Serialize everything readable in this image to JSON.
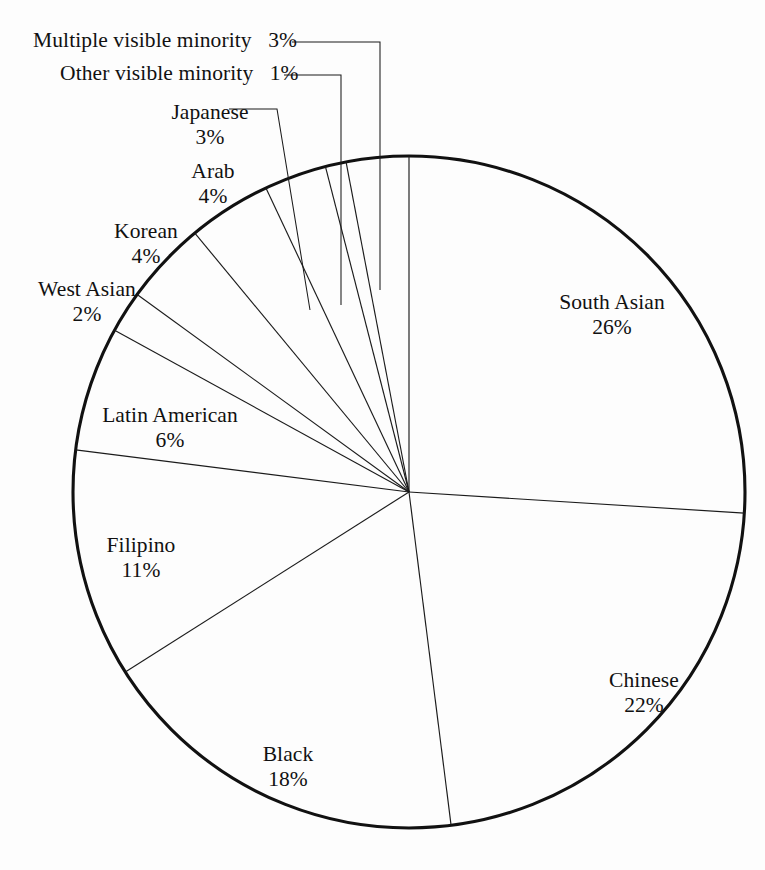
{
  "chart_data": {
    "type": "pie",
    "title": "",
    "subtitle": "",
    "xlabel": "",
    "ylabel": "",
    "legend_position": "none",
    "grid": false,
    "labels_show_percent": true,
    "start_angle_deg": 0,
    "direction": "clockwise",
    "categories": [
      "South Asian",
      "Chinese",
      "Black",
      "Filipino",
      "Latin American",
      "West Asian",
      "Korean",
      "Arab",
      "Japanese",
      "Other visible minority",
      "Multiple visible minority"
    ],
    "values": [
      26,
      22,
      18,
      11,
      6,
      2,
      4,
      4,
      3,
      1,
      3
    ],
    "units": "percent",
    "total": 100,
    "slices": [
      {
        "label": "South Asian",
        "value": 26,
        "percent_text": "26%"
      },
      {
        "label": "Chinese",
        "value": 22,
        "percent_text": "22%"
      },
      {
        "label": "Black",
        "value": 18,
        "percent_text": "18%"
      },
      {
        "label": "Filipino",
        "value": 11,
        "percent_text": "11%"
      },
      {
        "label": "Latin American",
        "value": 6,
        "percent_text": "6%"
      },
      {
        "label": "West Asian",
        "value": 2,
        "percent_text": "2%"
      },
      {
        "label": "Korean",
        "value": 4,
        "percent_text": "4%"
      },
      {
        "label": "Arab",
        "value": 4,
        "percent_text": "4%"
      },
      {
        "label": "Japanese",
        "value": 3,
        "percent_text": "3%"
      },
      {
        "label": "Other visible minority",
        "value": 1,
        "percent_text": "1%"
      },
      {
        "label": "Multiple visible minority",
        "value": 3,
        "percent_text": "3%"
      }
    ]
  },
  "labels": {
    "multiple": {
      "name": "Multiple visible minority",
      "pct": "3%"
    },
    "other": {
      "name": "Other visible minority",
      "pct": "1%"
    },
    "japanese": {
      "name": "Japanese",
      "pct": "3%"
    },
    "arab": {
      "name": "Arab",
      "pct": "4%"
    },
    "korean": {
      "name": "Korean",
      "pct": "4%"
    },
    "westasian": {
      "name": "West Asian",
      "pct": "2%"
    },
    "latin": {
      "name": "Latin American",
      "pct": "6%"
    },
    "filipino": {
      "name": "Filipino",
      "pct": "11%"
    },
    "black": {
      "name": "Black",
      "pct": "18%"
    },
    "chinese": {
      "name": "Chinese",
      "pct": "22%"
    },
    "southasian": {
      "name": "South Asian",
      "pct": "26%"
    }
  },
  "style": {
    "background": "#fdfdfd",
    "stroke": "#111111",
    "divider": "#1b1b1b",
    "text": "#111111"
  }
}
